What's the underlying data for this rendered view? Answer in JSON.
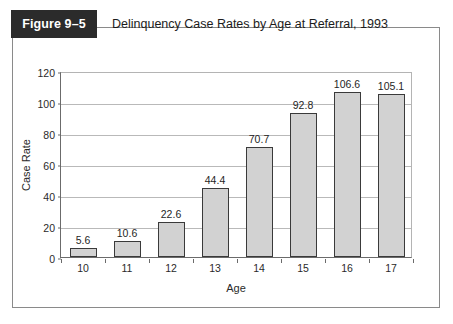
{
  "figure": {
    "badge_label": "Figure 9–5",
    "title": "Delinquency Case Rates by Age at Referral, 1993",
    "source_caption": ""
  },
  "chart_data": {
    "type": "bar",
    "title": "Delinquency Case Rates by Age at Referral, 1993",
    "categories": [
      "10",
      "11",
      "12",
      "13",
      "14",
      "15",
      "16",
      "17"
    ],
    "values": [
      5.6,
      10.6,
      22.6,
      44.4,
      70.7,
      92.8,
      106.6,
      105.1
    ],
    "value_labels": [
      "5.6",
      "10.6",
      "22.6",
      "44.4",
      "70.7",
      "92.8",
      "106.6",
      "105.1"
    ],
    "xlabel": "Age",
    "ylabel": "Case Rate",
    "ylim": [
      0,
      120
    ],
    "yticks": [
      0,
      20,
      40,
      60,
      80,
      100,
      120
    ],
    "ytick_labels": [
      "0",
      "20",
      "40",
      "60",
      "80",
      "100",
      "120"
    ],
    "grid": true,
    "legend": null,
    "bar_fill_color": "#d2d2d2",
    "bar_border_color": "#3a3a3a"
  }
}
